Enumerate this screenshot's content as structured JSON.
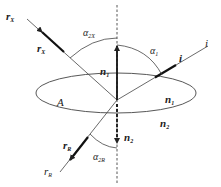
{
  "diagram": {
    "type": "optics-reflection-refraction",
    "labels": {
      "r_x_end": "r",
      "r_x_end_sub": "X",
      "r_x_vec": "r",
      "r_x_vec_sub": "X",
      "alpha_2x": "α",
      "alpha_2x_sub": "2X",
      "alpha_1": "α",
      "alpha_1_sub": "1",
      "i_vec": "i",
      "i_end": "i",
      "n1_vec": "n",
      "n1_vec_sub": "1",
      "surface": "A",
      "n1_medium": "n",
      "n1_medium_sub": "1",
      "n2_medium": "n",
      "n2_medium_sub": "2",
      "n2_vec": "n",
      "n2_vec_sub": "2",
      "r_r_vec": "r",
      "r_r_vec_sub": "R",
      "r_r_end": "r",
      "r_r_end_sub": "R",
      "alpha_2r": "α",
      "alpha_2r_sub": "2R"
    },
    "colors": {
      "line": "#333333",
      "background": "#ffffff"
    }
  }
}
